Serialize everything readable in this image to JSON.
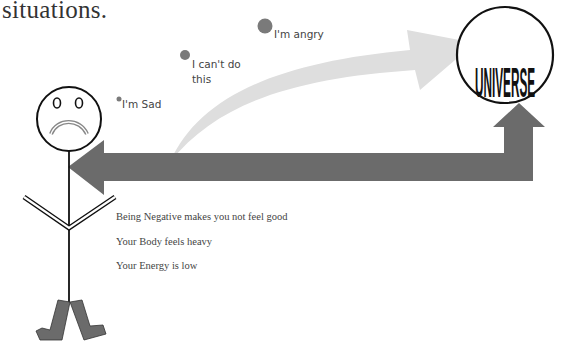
{
  "heading": {
    "text": "situations."
  },
  "thought_bubbles": [
    {
      "label": "I'm Sad",
      "size": "small"
    },
    {
      "label": "I can't do",
      "label_line2": "this",
      "size": "medium"
    },
    {
      "label": "I'm angry",
      "size": "large"
    }
  ],
  "universe": {
    "text": "UNIVERSE"
  },
  "notes": [
    "Being Negative makes you not feel good",
    "Your Body feels heavy",
    "Your Energy is low"
  ],
  "colors": {
    "text": "#444444",
    "bubble": "#7a7a7a",
    "curved_arrow": "#dedede",
    "return_arrow": "#6b6b6b",
    "feet": "#6b6b6b",
    "outline": "#111111"
  }
}
